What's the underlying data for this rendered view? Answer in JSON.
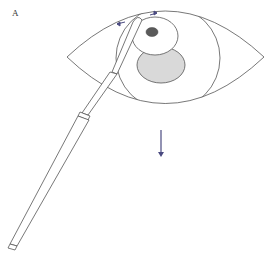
{
  "figure": {
    "panel_label": "A",
    "colors": {
      "outline": "#555555",
      "gray_region": "#d9d9d9",
      "dark_spot": "#5a5a5a",
      "arrow": "#4a4a80",
      "background": "#ffffff"
    },
    "elements": {
      "eye_outline": "almond-shaped eye outline",
      "iris": "large circle within eye",
      "flap": "white oval overlapping upper iris",
      "spot": "dark spot on flap",
      "gray_region": "light gray ellipse below flap",
      "instrument": "long thin surgical instrument with handle",
      "small_arrows": "two small blue arrows near instrument tip",
      "down_arrow": "vertical arrow pointing down below eye"
    }
  }
}
